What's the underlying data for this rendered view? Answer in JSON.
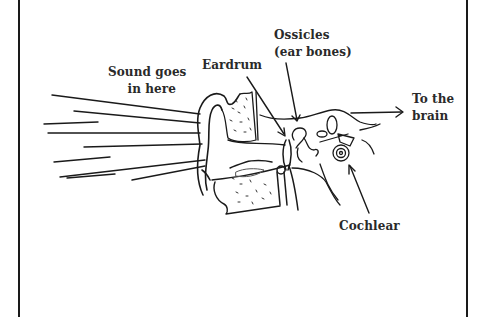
{
  "diagram": {
    "labels": {
      "sound": [
        "Sound goes",
        "in here"
      ],
      "eardrum": "Eardrum",
      "ossicles": [
        "Ossicles",
        "(ear bones)"
      ],
      "brain": [
        "To the",
        "brain"
      ],
      "cochlear": "Cochlear"
    },
    "colors": {
      "ink": "#1a1a1a",
      "text": "#2a2a2a",
      "background": "#ffffff"
    }
  }
}
